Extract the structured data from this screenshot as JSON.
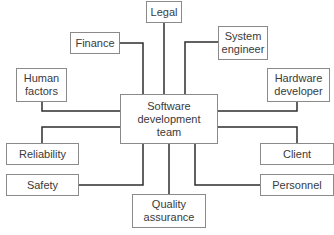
{
  "diagram": {
    "center": {
      "label": "Software\ndevelopment\nteam",
      "x": 120,
      "y": 94,
      "w": 98,
      "h": 50
    },
    "nodes": [
      {
        "id": "legal",
        "label": "Legal",
        "x": 146,
        "y": 1,
        "w": 36,
        "h": 22
      },
      {
        "id": "finance",
        "label": "Finance",
        "x": 70,
        "y": 32,
        "w": 50,
        "h": 22
      },
      {
        "id": "system-engineer",
        "label": "System\nengineer",
        "x": 218,
        "y": 26,
        "w": 50,
        "h": 34
      },
      {
        "id": "human-factors",
        "label": "Human\nfactors",
        "x": 16,
        "y": 68,
        "w": 51,
        "h": 34
      },
      {
        "id": "hardware-developer",
        "label": "Hardware\ndeveloper",
        "x": 267,
        "y": 68,
        "w": 63,
        "h": 34
      },
      {
        "id": "reliability",
        "label": "Reliability",
        "x": 6,
        "y": 143,
        "w": 73,
        "h": 22
      },
      {
        "id": "safety",
        "label": "Safety",
        "x": 6,
        "y": 174,
        "w": 73,
        "h": 22
      },
      {
        "id": "client",
        "label": "Client",
        "x": 260,
        "y": 143,
        "w": 74,
        "h": 22
      },
      {
        "id": "personnel",
        "label": "Personnel",
        "x": 260,
        "y": 174,
        "w": 74,
        "h": 22
      },
      {
        "id": "quality-assurance",
        "label": "Quality\nassurance",
        "x": 132,
        "y": 194,
        "w": 74,
        "h": 34
      }
    ],
    "line_color": "#2e2e2e"
  }
}
